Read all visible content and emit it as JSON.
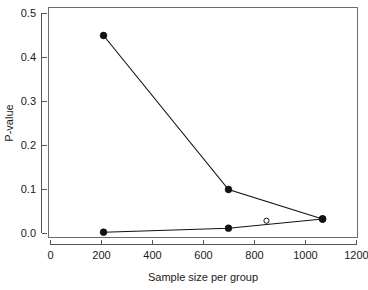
{
  "chart_data": {
    "type": "line",
    "title": "",
    "xlabel": "Sample size per group",
    "ylabel": "P-value",
    "xlim": [
      0,
      1200
    ],
    "ylim": [
      0.0,
      0.5
    ],
    "grid": false,
    "legend": "none",
    "xticks": [
      0,
      200,
      400,
      600,
      800,
      1000,
      1200
    ],
    "xtick_labels": [
      "0",
      "200",
      "400",
      "600",
      "800",
      "1000",
      "1200"
    ],
    "yticks": [
      0.0,
      0.1,
      0.2,
      0.3,
      0.4,
      0.5
    ],
    "ytick_labels": [
      "0.0",
      "0.1",
      "0.2",
      "0.3",
      "0.4",
      "0.5"
    ],
    "series": [
      {
        "name": "upper-series",
        "marker": "filled-circle",
        "x": [
          208,
          698,
          1067
        ],
        "values": [
          0.45,
          0.1,
          0.033
        ]
      },
      {
        "name": "lower-series",
        "marker": "filled-circle",
        "x": [
          208,
          698,
          1067
        ],
        "values": [
          0.003,
          0.012,
          0.033
        ]
      }
    ],
    "extra_points": [
      {
        "name": "open-circle-point",
        "marker": "open-circle",
        "x": 847,
        "y": 0.029
      }
    ]
  },
  "axes": {
    "x_title": "Sample size per group",
    "y_title": "P-value"
  }
}
